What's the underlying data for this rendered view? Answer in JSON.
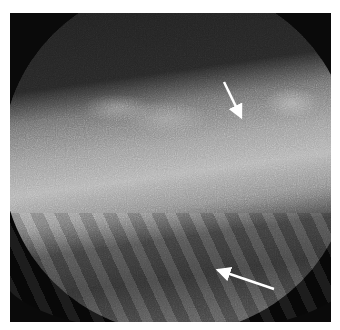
{
  "image": {
    "description": "Grayscale circular-field fluoroscopic radiograph with noisy texture, a bright horizontal band across the middle, and striated structures in the lower portion",
    "background_color": "#ffffff",
    "frame_color": "#0a0a0a",
    "field_shape": "circle",
    "annotations": [
      {
        "type": "arrow",
        "color": "#ffffff",
        "from": [
          224,
          82
        ],
        "to": [
          241,
          117
        ],
        "label": "upper-arrow"
      },
      {
        "type": "arrow",
        "color": "#ffffff",
        "from": [
          274,
          289
        ],
        "to": [
          218,
          270
        ],
        "label": "lower-arrow"
      }
    ]
  }
}
